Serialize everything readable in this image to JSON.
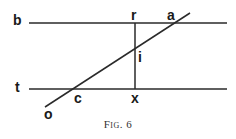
{
  "figure": {
    "caption": "Fig. 6",
    "labels": {
      "b": "b",
      "t": "t",
      "r": "r",
      "a": "a",
      "i": "i",
      "c": "c",
      "x": "x",
      "o": "o"
    },
    "colors": {
      "stroke": "#2a2a2a",
      "text": "#1a1a1a"
    }
  }
}
